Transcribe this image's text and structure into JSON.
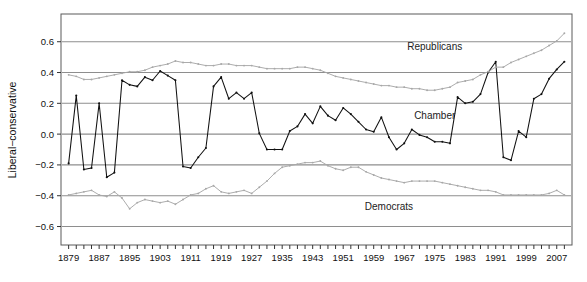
{
  "chart_data": {
    "type": "line",
    "title": "",
    "xlabel": "",
    "ylabel": "Liberal−conservative",
    "xlim": [
      1877,
      2011
    ],
    "ylim": [
      -0.72,
      0.78
    ],
    "yticks": [
      -0.6,
      -0.4,
      -0.2,
      0.0,
      0.2,
      0.4,
      0.6
    ],
    "ytick_labels": [
      "−0.6",
      "−0.4",
      "−0.2",
      "0.0",
      "0.2",
      "0.4",
      "0.6"
    ],
    "xticks": [
      1879,
      1881,
      1883,
      1885,
      1887,
      1889,
      1891,
      1893,
      1895,
      1897,
      1899,
      1901,
      1903,
      1905,
      1907,
      1909,
      1911,
      1913,
      1915,
      1917,
      1919,
      1921,
      1923,
      1925,
      1927,
      1929,
      1931,
      1933,
      1935,
      1937,
      1939,
      1941,
      1943,
      1945,
      1947,
      1949,
      1951,
      1953,
      1955,
      1957,
      1959,
      1961,
      1963,
      1965,
      1967,
      1969,
      1971,
      1973,
      1975,
      1977,
      1979,
      1981,
      1983,
      1985,
      1987,
      1989,
      1991,
      1993,
      1995,
      1997,
      1999,
      2001,
      2003,
      2005,
      2007,
      2009
    ],
    "xtick_labels": [
      "1879",
      "1887",
      "1895",
      "1903",
      "1911",
      "1919",
      "1927",
      "1935",
      "1943",
      "1951",
      "1959",
      "1967",
      "1975",
      "1983",
      "1991",
      "1999",
      "2007"
    ],
    "xtick_label_years": [
      1879,
      1887,
      1895,
      1903,
      1911,
      1919,
      1927,
      1935,
      1943,
      1951,
      1959,
      1967,
      1975,
      1983,
      1991,
      1999,
      2007
    ],
    "grid": true,
    "gridlines_y": [
      -0.6,
      -0.4,
      -0.2,
      0.0,
      0.2,
      0.4,
      0.6
    ],
    "legend_position": "inline-annotations",
    "annotations": [
      {
        "text": "Republicans",
        "x": 1975,
        "y": 0.545
      },
      {
        "text": "Chamber",
        "x": 1975,
        "y": 0.095
      },
      {
        "text": "Democrats",
        "x": 1963,
        "y": -0.495
      }
    ],
    "series": [
      {
        "name": "Chamber",
        "color": "#111111",
        "marker": "point",
        "x": [
          1879,
          1881,
          1883,
          1885,
          1887,
          1889,
          1891,
          1893,
          1895,
          1897,
          1899,
          1901,
          1903,
          1905,
          1907,
          1909,
          1911,
          1913,
          1915,
          1917,
          1919,
          1921,
          1923,
          1925,
          1927,
          1929,
          1931,
          1933,
          1935,
          1937,
          1939,
          1941,
          1943,
          1945,
          1947,
          1949,
          1951,
          1953,
          1955,
          1957,
          1959,
          1961,
          1963,
          1965,
          1967,
          1969,
          1971,
          1973,
          1975,
          1977,
          1979,
          1981,
          1983,
          1985,
          1987,
          1989,
          1991,
          1993,
          1995,
          1997,
          1999,
          2001,
          2003,
          2005,
          2007,
          2009
        ],
        "values": [
          -0.19,
          0.25,
          -0.23,
          -0.22,
          0.2,
          -0.28,
          -0.25,
          0.35,
          0.32,
          0.31,
          0.37,
          0.35,
          0.41,
          0.38,
          0.35,
          -0.21,
          -0.22,
          -0.15,
          -0.09,
          0.31,
          0.37,
          0.23,
          0.27,
          0.23,
          0.27,
          0.005,
          -0.1,
          -0.1,
          -0.1,
          0.02,
          0.05,
          0.13,
          0.07,
          0.18,
          0.12,
          0.09,
          0.17,
          0.13,
          0.08,
          0.03,
          0.015,
          0.11,
          -0.02,
          -0.1,
          -0.06,
          0.03,
          -0.005,
          -0.02,
          -0.05,
          -0.05,
          -0.06,
          0.24,
          0.2,
          0.21,
          0.26,
          0.4,
          0.47,
          -0.15,
          -0.17,
          0.02,
          -0.02,
          0.23,
          0.26,
          0.36,
          0.42,
          0.47
        ]
      },
      {
        "name": "Republicans",
        "color": "#a8a8a8",
        "marker": "point",
        "x": [
          1879,
          1881,
          1883,
          1885,
          1887,
          1889,
          1891,
          1893,
          1895,
          1897,
          1899,
          1901,
          1903,
          1905,
          1907,
          1909,
          1911,
          1913,
          1915,
          1917,
          1919,
          1921,
          1923,
          1925,
          1927,
          1929,
          1931,
          1933,
          1935,
          1937,
          1939,
          1941,
          1943,
          1945,
          1947,
          1949,
          1951,
          1953,
          1955,
          1957,
          1959,
          1961,
          1963,
          1965,
          1967,
          1969,
          1971,
          1973,
          1975,
          1977,
          1979,
          1981,
          1983,
          1985,
          1987,
          1989,
          1991,
          1993,
          1995,
          1997,
          1999,
          2001,
          2003,
          2005,
          2007,
          2009
        ],
        "values": [
          0.385,
          0.375,
          0.355,
          0.355,
          0.365,
          0.375,
          0.385,
          0.395,
          0.405,
          0.405,
          0.415,
          0.435,
          0.445,
          0.455,
          0.475,
          0.465,
          0.465,
          0.455,
          0.445,
          0.445,
          0.455,
          0.455,
          0.445,
          0.445,
          0.445,
          0.435,
          0.425,
          0.425,
          0.425,
          0.425,
          0.435,
          0.435,
          0.425,
          0.415,
          0.395,
          0.375,
          0.365,
          0.355,
          0.345,
          0.335,
          0.325,
          0.315,
          0.315,
          0.305,
          0.305,
          0.295,
          0.295,
          0.285,
          0.285,
          0.295,
          0.305,
          0.335,
          0.345,
          0.355,
          0.385,
          0.405,
          0.435,
          0.435,
          0.465,
          0.485,
          0.505,
          0.525,
          0.545,
          0.575,
          0.605,
          0.655
        ]
      },
      {
        "name": "Democrats",
        "color": "#a8a8a8",
        "marker": "point",
        "x": [
          1879,
          1881,
          1883,
          1885,
          1887,
          1889,
          1891,
          1893,
          1895,
          1897,
          1899,
          1901,
          1903,
          1905,
          1907,
          1909,
          1911,
          1913,
          1915,
          1917,
          1919,
          1921,
          1923,
          1925,
          1927,
          1929,
          1931,
          1933,
          1935,
          1937,
          1939,
          1941,
          1943,
          1945,
          1947,
          1949,
          1951,
          1953,
          1955,
          1957,
          1959,
          1961,
          1963,
          1965,
          1967,
          1969,
          1971,
          1973,
          1975,
          1977,
          1979,
          1981,
          1983,
          1985,
          1987,
          1989,
          1991,
          1993,
          1995,
          1997,
          1999,
          2001,
          2003,
          2005,
          2007,
          2009
        ],
        "values": [
          -0.395,
          -0.385,
          -0.375,
          -0.365,
          -0.395,
          -0.405,
          -0.375,
          -0.415,
          -0.485,
          -0.445,
          -0.425,
          -0.435,
          -0.445,
          -0.435,
          -0.455,
          -0.425,
          -0.395,
          -0.385,
          -0.355,
          -0.335,
          -0.375,
          -0.385,
          -0.375,
          -0.365,
          -0.385,
          -0.345,
          -0.305,
          -0.255,
          -0.215,
          -0.205,
          -0.195,
          -0.185,
          -0.185,
          -0.175,
          -0.205,
          -0.225,
          -0.235,
          -0.215,
          -0.215,
          -0.245,
          -0.265,
          -0.285,
          -0.295,
          -0.305,
          -0.315,
          -0.305,
          -0.305,
          -0.305,
          -0.305,
          -0.315,
          -0.325,
          -0.335,
          -0.345,
          -0.355,
          -0.365,
          -0.365,
          -0.375,
          -0.395,
          -0.395,
          -0.395,
          -0.395,
          -0.395,
          -0.395,
          -0.385,
          -0.365,
          -0.395
        ]
      }
    ]
  }
}
